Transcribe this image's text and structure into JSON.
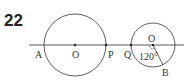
{
  "problem_number": "22",
  "labels": {
    "A": "A",
    "O": "O",
    "P": "P",
    "Q": "Q",
    "O2": "O",
    "B": "B",
    "angle": "120°"
  }
}
